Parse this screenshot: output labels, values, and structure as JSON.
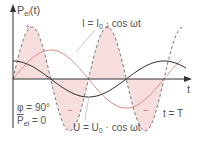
{
  "diagram": {
    "type": "ac-power-waveforms",
    "y_axis_label": {
      "main": "P",
      "sub": "el",
      "suffix": "(t)"
    },
    "x_axis_label": "t",
    "current_label": {
      "lhs": "I = I",
      "sub": "0",
      "rhs": " · cos ωt"
    },
    "voltage_label": {
      "lhs": "U = U",
      "sub": "0",
      "rhs": " · cos ωt"
    },
    "phase_label": "φ = 90°",
    "mean_power_label": {
      "main": "P",
      "sub": "el",
      "rhs": " = 0"
    },
    "period_label": "t = T",
    "plus_sign": "+",
    "minus_sign": "−",
    "colors": {
      "axis": "#333333",
      "current_curve": "#333333",
      "voltage_curve": "#e08a8a",
      "power_curve": "#666666",
      "power_fill": "#f6dede",
      "sign_marks": "#d06060",
      "text": "#555555"
    }
  },
  "chart_data": {
    "type": "line",
    "title": "",
    "xlabel": "t",
    "ylabel": "P_el(t)",
    "x_range": [
      "0",
      "T"
    ],
    "series": [
      {
        "name": "current (black)",
        "shape": "cos",
        "relative_amplitude": 0.32,
        "style": "solid"
      },
      {
        "name": "voltage (red)",
        "shape": "sin",
        "relative_amplitude": 0.5,
        "style": "solid"
      },
      {
        "name": "power P_el(t)",
        "shape": "sin(2ωt)",
        "relative_amplitude": 1.0,
        "style": "dashed",
        "filled": true
      }
    ],
    "annotations": [
      "+",
      "+",
      "−",
      "−",
      "φ = 90°",
      "P̄_el = 0",
      "t = T"
    ],
    "grid": false
  }
}
